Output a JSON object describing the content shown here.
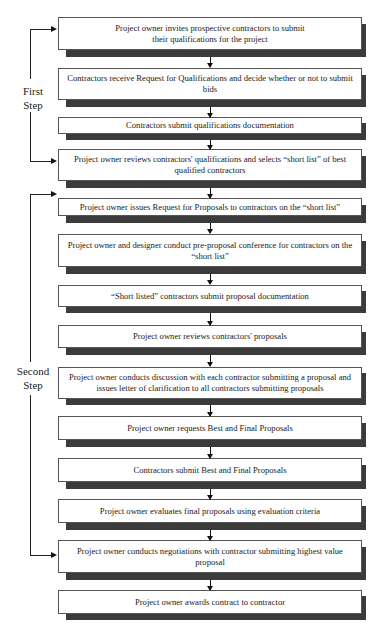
{
  "diagram": {
    "type": "flowchart",
    "steps": [
      {
        "label": "First Step",
        "line1": "First",
        "line2": "Step"
      },
      {
        "label": "Second Step",
        "line1": "Second",
        "line2": "Step"
      }
    ],
    "boxes": [
      {
        "text": "Project owner invites prospective contractors to submit their qualifications for the project",
        "step": "First Step"
      },
      {
        "text": "Contractors receive Request for Qualifications and decide whether or not to submit bids",
        "step": "First Step"
      },
      {
        "text": "Contractors submit qualifications documentation",
        "step": "First Step"
      },
      {
        "text": "Project owner reviews contractors' qualifications and selects “short list” of best qualified contractors",
        "step": "First Step"
      },
      {
        "text": "Project owner issues Request for Proposals to contractors on the “short list”",
        "step": "Second Step"
      },
      {
        "text": "Project owner and designer conduct pre-proposal conference for contractors on the “short list”",
        "step": "Second Step"
      },
      {
        "text": "“Short listed” contractors submit proposal documentation",
        "step": "Second Step"
      },
      {
        "text": "Project owner reviews contractors' proposals",
        "step": "Second Step"
      },
      {
        "text": "Project owner conducts discussion with each contractor submitting a proposal and issues letter of clarification to all contractors submitting proposals",
        "step": "Second Step"
      },
      {
        "text": "Project owner requests Best and Final Proposals",
        "step": "Second Step"
      },
      {
        "text": "Contractors submit Best and Final Proposals",
        "step": "Second Step"
      },
      {
        "text": "Project owner evaluates final proposals using evaluation criteria",
        "step": "Second Step"
      },
      {
        "text": "Project owner conducts negotiations with contractor submitting highest value proposal",
        "step": "Second Step"
      },
      {
        "text": "Project owner awards contract to contractor",
        "step": "Second Step"
      }
    ],
    "colors": {
      "box_fill": "#ffffff",
      "box_border": "#555555",
      "shadow": "#3b3b3b",
      "lines": "#111111"
    }
  }
}
